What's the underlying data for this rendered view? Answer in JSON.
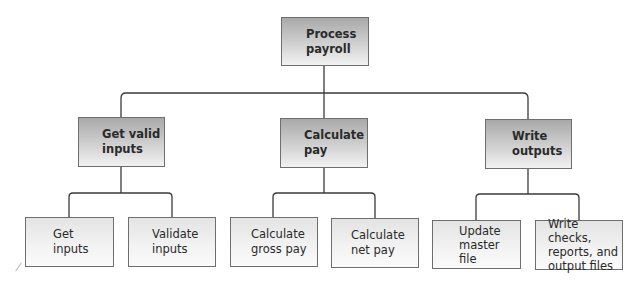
{
  "diagram": {
    "type": "hierarchy-chart",
    "root": {
      "label": "Process\npayroll"
    },
    "level2": [
      {
        "label": "Get valid\ninputs"
      },
      {
        "label": "Calculate\npay"
      },
      {
        "label": "Write\noutputs"
      }
    ],
    "level3": [
      {
        "label": "Get\ninputs",
        "parent": "Get valid inputs"
      },
      {
        "label": "Validate\ninputs",
        "parent": "Get valid inputs"
      },
      {
        "label": "Calculate\ngross pay",
        "parent": "Calculate pay"
      },
      {
        "label": "Calculate\nnet pay",
        "parent": "Calculate pay"
      },
      {
        "label": "Update\nmaster\nfile",
        "parent": "Write outputs"
      },
      {
        "label": "Write checks,\nreports, and\noutput files",
        "parent": "Write outputs"
      }
    ],
    "colors": {
      "line": "#3a3a3a",
      "border": "#6e6e6e",
      "shaded_top": "#a9a9a9",
      "shaded_bottom": "#f2f2f2",
      "light_fill": "#f2f2f2"
    }
  }
}
